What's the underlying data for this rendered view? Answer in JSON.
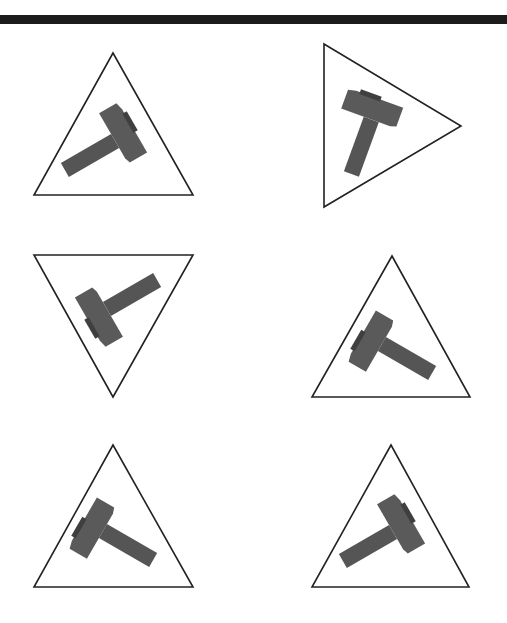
{
  "figure": {
    "colors": {
      "background": "#ffffff",
      "top_bar": "#1c1c1c",
      "outline": "#222222",
      "hammer_handle": "#555555",
      "hammer_head": "#5a5a5a",
      "hammer_face": "#3f3f3f"
    },
    "panels": [
      {
        "id": 1,
        "position": "top-left",
        "triangle": "apex-up",
        "hammer_icon": "hammer-icon"
      },
      {
        "id": 2,
        "position": "top-right",
        "triangle": "apex-right",
        "hammer_icon": "hammer-icon"
      },
      {
        "id": 3,
        "position": "middle-left",
        "triangle": "apex-down",
        "hammer_icon": "hammer-icon"
      },
      {
        "id": 4,
        "position": "middle-right",
        "triangle": "apex-up",
        "hammer_icon": "hammer-icon"
      },
      {
        "id": 5,
        "position": "bottom-left",
        "triangle": "apex-up",
        "hammer_icon": "hammer-icon"
      },
      {
        "id": 6,
        "position": "bottom-right",
        "triangle": "apex-up",
        "hammer_icon": "hammer-icon"
      }
    ]
  }
}
